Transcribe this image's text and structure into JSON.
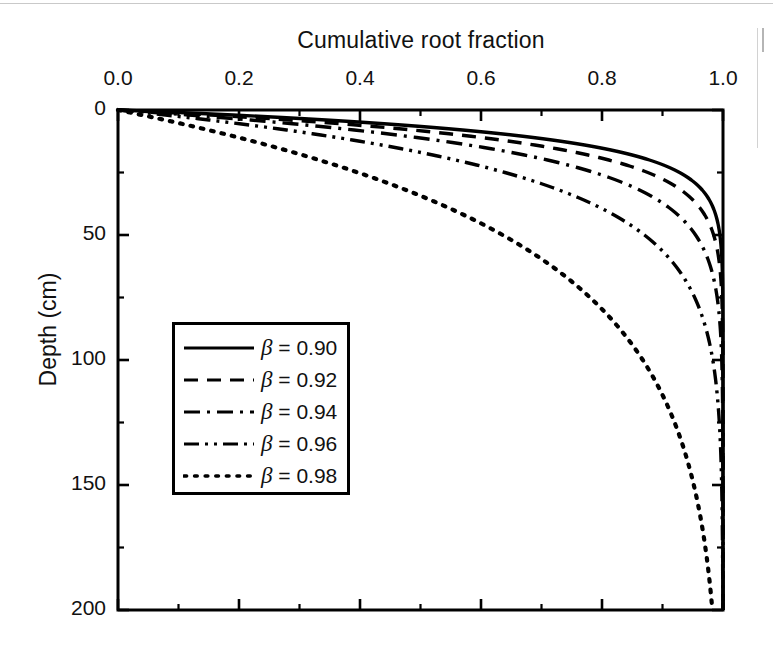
{
  "chart_data": {
    "type": "line",
    "title": "Cumulative root fraction",
    "xlabel": "Cumulative root fraction",
    "ylabel": "Depth (cm)",
    "xlim": [
      0.0,
      1.0
    ],
    "ylim": [
      0,
      200
    ],
    "y_inverted": true,
    "xlabel_position": "top",
    "grid": false,
    "legend_position": "inside-left",
    "xticks": [
      0.0,
      0.2,
      0.4,
      0.6,
      0.8,
      1.0
    ],
    "xtick_labels": [
      "0.0",
      "0.2",
      "0.4",
      "0.6",
      "0.8",
      "1.0"
    ],
    "x_minor_tick_interval": 0.1,
    "yticks": [
      0,
      50,
      100,
      150,
      200
    ],
    "ytick_labels": [
      "0",
      "50",
      "100",
      "150",
      "200"
    ],
    "y_minor_tick_interval": 25,
    "model": "Y = 1 - beta^d",
    "line_color": "#000000",
    "series": [
      {
        "name": "β = 0.90",
        "beta": 0.9,
        "dash": "solid",
        "x": [
          0,
          0.1,
          0.19,
          0.271,
          0.344,
          0.41,
          0.469,
          0.522,
          0.57,
          0.613,
          0.651,
          0.686,
          0.718,
          0.746,
          0.771,
          0.794,
          0.815,
          0.833,
          0.85,
          0.865,
          0.878,
          0.89,
          0.901,
          0.911,
          0.919,
          0.927,
          0.934,
          0.941,
          0.947,
          0.952,
          0.957,
          0.961,
          0.965,
          0.968,
          0.971,
          0.974,
          0.977,
          0.979,
          0.981,
          0.983,
          0.9852,
          0.9867,
          0.988,
          0.9892,
          0.9903,
          0.9913,
          0.9921,
          0.9929,
          0.9936,
          0.9943,
          0.9948
        ],
        "depths": [
          0,
          10,
          20,
          30,
          40,
          50,
          60,
          70,
          80,
          90,
          100,
          110,
          120,
          130,
          140,
          150,
          160,
          170,
          180,
          190,
          200,
          210,
          220,
          230,
          240,
          250,
          260,
          270,
          280,
          290,
          300,
          310,
          320,
          330,
          340,
          350,
          360,
          370,
          380,
          390,
          400,
          410,
          420,
          430,
          440,
          450,
          460,
          470,
          480,
          490,
          500
        ]
      },
      {
        "name": "β = 0.92",
        "beta": 0.92,
        "dash": "dashed",
        "x_at_depths": {
          "0": 0,
          "10": 0.434,
          "25": 0.877,
          "50": 0.985,
          "75": 0.998,
          "100": 0.9998,
          "150": 1.0,
          "200": 1.0
        }
      },
      {
        "name": "β = 0.94",
        "beta": 0.94,
        "dash": "dashdot",
        "x_at_depths": {
          "0": 0,
          "10": 0.461,
          "25": 0.786,
          "50": 0.954,
          "75": 0.99,
          "100": 0.998,
          "150": 1.0,
          "200": 1.0
        }
      },
      {
        "name": "β = 0.96",
        "beta": 0.96,
        "dash": "dashdotdot",
        "x_at_depths": {
          "0": 0,
          "10": 0.335,
          "25": 0.64,
          "50": 0.87,
          "75": 0.953,
          "100": 0.983,
          "150": 0.998,
          "200": 0.9997
        }
      },
      {
        "name": "β = 0.98",
        "beta": 0.98,
        "dash": "dotted",
        "x_at_depths": {
          "0": 0,
          "10": 0.183,
          "25": 0.397,
          "50": 0.636,
          "75": 0.78,
          "100": 0.867,
          "150": 0.952,
          "200": 0.982
        }
      }
    ]
  },
  "axes": {
    "title_top": "Cumulative root fraction",
    "ylabel": "Depth (cm)"
  },
  "legend": {
    "entries": [
      {
        "label_prefix": "β",
        "label_rest": " = 0.90",
        "dash": "solid"
      },
      {
        "label_prefix": "β",
        "label_rest": " = 0.92",
        "dash": "dashed"
      },
      {
        "label_prefix": "β",
        "label_rest": " = 0.94",
        "dash": "dashdot"
      },
      {
        "label_prefix": "β",
        "label_rest": " = 0.96",
        "dash": "dashdotdot"
      },
      {
        "label_prefix": "β",
        "label_rest": " = 0.98",
        "dash": "dotted"
      }
    ]
  }
}
